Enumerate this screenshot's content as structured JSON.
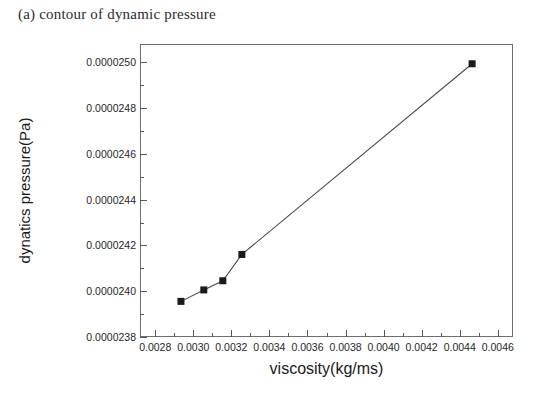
{
  "caption": "(a) contour of dynamic pressure",
  "chart_data": {
    "type": "line",
    "title": "",
    "subtitle": "",
    "caption": "(a) contour of dynamic pressure",
    "xlabel": "viscosity(kg/ms)",
    "ylabel": "dynatics pressure(Pa)",
    "xlim": [
      0.00272,
      0.00468
    ],
    "ylim": [
      2.38e-05,
      2.508e-05
    ],
    "grid": false,
    "legend": null,
    "legend_position": "none",
    "marker": "square",
    "marker_color": "#1a1a1a",
    "line_color": "#4a4a4a",
    "x_major_ticks": [
      0.0028,
      0.003,
      0.0032,
      0.0034,
      0.0036,
      0.0038,
      0.004,
      0.0042,
      0.0044,
      0.0046
    ],
    "x_tick_labels": [
      "0.0028",
      "0.0030",
      "0.0032",
      "0.0034",
      "0.0036",
      "0.0038",
      "0.0040",
      "0.0042",
      "0.0044",
      "0.0046"
    ],
    "x_minor_step": 0.0001,
    "y_major_ticks": [
      2.38e-05,
      2.4e-05,
      2.42e-05,
      2.44e-05,
      2.46e-05,
      2.48e-05,
      2.5e-05
    ],
    "y_tick_labels": [
      "0.0000238",
      "0.0000240",
      "0.0000242",
      "0.0000244",
      "0.0000246",
      "0.0000248",
      "0.0000250"
    ],
    "y_minor_step": 1e-07,
    "series": [
      {
        "name": "dynamic pressure vs viscosity",
        "x": [
          0.00293,
          0.00305,
          0.00315,
          0.00325,
          0.00446
        ],
        "y": [
          2.396e-05,
          2.401e-05,
          2.405e-05,
          2.4165e-05,
          2.4998e-05
        ]
      }
    ]
  }
}
